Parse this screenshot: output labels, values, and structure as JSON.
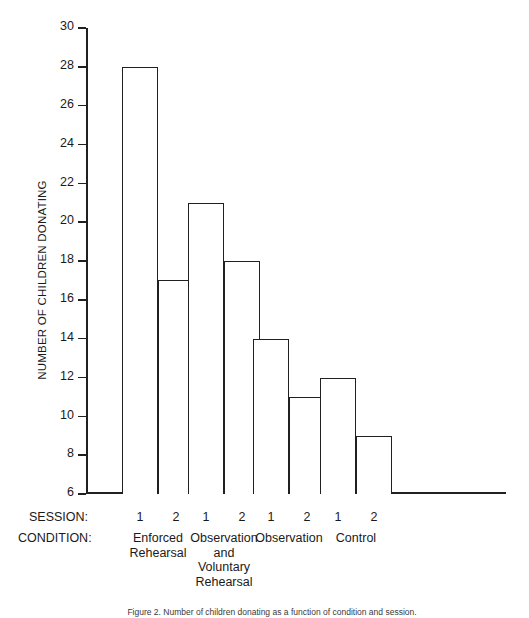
{
  "chart_data": {
    "type": "bar",
    "title": "",
    "xlabel": "",
    "ylabel": "NUMBER OF CHILDREN DONATING",
    "ylim": [
      6,
      30
    ],
    "ytick_step": 2,
    "yticks": [
      30,
      28,
      26,
      24,
      22,
      20,
      18,
      16,
      14,
      12,
      10,
      8,
      6
    ],
    "grid": false,
    "legend": "none",
    "categories": [
      "Enforced Rehearsal",
      "Observation and Voluntary Rehearsal",
      "Observation",
      "Control"
    ],
    "series": [
      {
        "name": "Session 1",
        "values": [
          28,
          21,
          14,
          12
        ]
      },
      {
        "name": "Session 2",
        "values": [
          17,
          18,
          11,
          9
        ]
      }
    ],
    "bars": [
      {
        "group": "Enforced Rehearsal",
        "session": "1",
        "value": 28
      },
      {
        "group": "Enforced Rehearsal",
        "session": "2",
        "value": 17
      },
      {
        "group": "Observation and Voluntary Rehearsal",
        "session": "1",
        "value": 21
      },
      {
        "group": "Observation and Voluntary Rehearsal",
        "session": "2",
        "value": 18
      },
      {
        "group": "Observation",
        "session": "1",
        "value": 14
      },
      {
        "group": "Observation",
        "session": "2",
        "value": 11
      },
      {
        "group": "Control",
        "session": "1",
        "value": 12
      },
      {
        "group": "Control",
        "session": "2",
        "value": 9
      }
    ],
    "bar_style": {
      "fill": "#ffffff",
      "stroke": "#202020"
    }
  },
  "axis": {
    "y_title": "NUMBER OF CHILDREN DONATING",
    "ticks": [
      {
        "label": "30",
        "value": 30
      },
      {
        "label": "28",
        "value": 28
      },
      {
        "label": "26",
        "value": 26
      },
      {
        "label": "24",
        "value": 24
      },
      {
        "label": "22",
        "value": 22
      },
      {
        "label": "20",
        "value": 20
      },
      {
        "label": "18",
        "value": 18
      },
      {
        "label": "16",
        "value": 16
      },
      {
        "label": "14",
        "value": 14
      },
      {
        "label": "12",
        "value": 12
      },
      {
        "label": "10",
        "value": 10
      },
      {
        "label": "8",
        "value": 8
      },
      {
        "label": "6",
        "value": 6
      }
    ]
  },
  "x_labels": {
    "session_key": "SESSION:",
    "condition_key": "CONDITION:",
    "sessions": [
      "1",
      "2",
      "1",
      "2",
      "1",
      "2",
      "1",
      "2"
    ],
    "conditions": [
      {
        "lines": [
          "Enforced",
          "Rehearsal"
        ]
      },
      {
        "lines": [
          "Observation",
          "and",
          "Voluntary",
          "Rehearsal"
        ]
      },
      {
        "lines": [
          "Observation"
        ]
      },
      {
        "lines": [
          "Control"
        ]
      }
    ]
  },
  "caption": {
    "text": "Figure 2. Number of children donating as a function of condition and session."
  },
  "colors": {
    "ink": "#1a1a1a",
    "line": "#202020",
    "background": "#ffffff"
  }
}
